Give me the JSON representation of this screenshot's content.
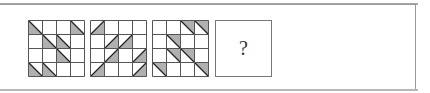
{
  "puzzle": {
    "grid_size": 4,
    "colors": {
      "line": "#555555",
      "fill": "#b0b0b0",
      "background": "#ffffff"
    },
    "panels": [
      {
        "id": "panel-1",
        "x": 28,
        "triangles": [
          {
            "r": 0,
            "c": 0,
            "type": "lower-left"
          },
          {
            "r": 0,
            "c": 3,
            "type": "lower-left"
          },
          {
            "r": 1,
            "c": 1,
            "type": "lower-left"
          },
          {
            "r": 1,
            "c": 2,
            "type": "lower-left"
          },
          {
            "r": 2,
            "c": 2,
            "type": "lower-left"
          },
          {
            "r": 3,
            "c": 0,
            "type": "lower-left"
          },
          {
            "r": 3,
            "c": 1,
            "type": "lower-left"
          }
        ]
      },
      {
        "id": "panel-2",
        "x": 90,
        "triangles": [
          {
            "r": 0,
            "c": 0,
            "type": "lower-right"
          },
          {
            "r": 1,
            "c": 1,
            "type": "lower-right"
          },
          {
            "r": 1,
            "c": 2,
            "type": "lower-right"
          },
          {
            "r": 2,
            "c": 1,
            "type": "lower-right"
          },
          {
            "r": 2,
            "c": 3,
            "type": "lower-right"
          },
          {
            "r": 3,
            "c": 0,
            "type": "lower-right"
          },
          {
            "r": 3,
            "c": 3,
            "type": "lower-right"
          }
        ]
      },
      {
        "id": "panel-3",
        "x": 152,
        "triangles": [
          {
            "r": 0,
            "c": 2,
            "type": "upper-right"
          },
          {
            "r": 0,
            "c": 3,
            "type": "upper-right"
          },
          {
            "r": 1,
            "c": 1,
            "type": "upper-right"
          },
          {
            "r": 2,
            "c": 1,
            "type": "upper-right"
          },
          {
            "r": 2,
            "c": 2,
            "type": "upper-right"
          },
          {
            "r": 3,
            "c": 0,
            "type": "upper-right"
          },
          {
            "r": 3,
            "c": 3,
            "type": "upper-right"
          }
        ]
      }
    ],
    "answer": {
      "label": "?"
    }
  }
}
